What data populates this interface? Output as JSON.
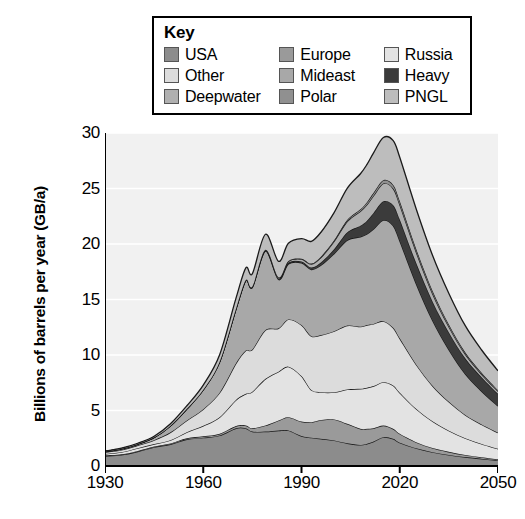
{
  "legend": {
    "title": "Key",
    "entries": [
      {
        "label": "USA",
        "color": "#8c8c8c",
        "column": 0,
        "row": 0
      },
      {
        "label": "Europe",
        "color": "#9a9a9a",
        "column": 1,
        "row": 0
      },
      {
        "label": "Russia",
        "color": "#e3e3e3",
        "column": 2,
        "row": 0
      },
      {
        "label": "Other",
        "color": "#dcdcdc",
        "column": 0,
        "row": 1
      },
      {
        "label": "Mideast",
        "color": "#a8a8a8",
        "column": 1,
        "row": 1
      },
      {
        "label": "Heavy",
        "color": "#3b3b3b",
        "column": 2,
        "row": 1
      },
      {
        "label": "Deepwater",
        "color": "#b0b0b0",
        "column": 0,
        "row": 2
      },
      {
        "label": "Polar",
        "color": "#909090",
        "column": 1,
        "row": 2
      },
      {
        "label": "PNGL",
        "color": "#bdbdbd",
        "column": 2,
        "row": 2
      }
    ]
  },
  "axes": {
    "ylabel": "Billions of barrels per year (GB/a)",
    "xlabel": "",
    "yticks": [
      0,
      5,
      10,
      15,
      20,
      25,
      30
    ],
    "xticks": [
      1930,
      1960,
      1990,
      2020,
      2050
    ],
    "xlim": [
      1930,
      2050
    ],
    "ylim": [
      0,
      30
    ],
    "grid": true
  },
  "chart_data": {
    "type": "area",
    "title": "",
    "xlabel": "",
    "ylabel": "Billions of barrels per year (GB/a)",
    "xlim": [
      1930,
      2050
    ],
    "ylim": [
      0,
      30
    ],
    "grid": true,
    "legend_position": "top",
    "stacked": true,
    "x": [
      1930,
      1935,
      1940,
      1945,
      1950,
      1955,
      1960,
      1965,
      1970,
      1973,
      1975,
      1979,
      1983,
      1986,
      1990,
      1993,
      1996,
      2000,
      2004,
      2008,
      2010,
      2012,
      2015,
      2018,
      2020,
      2025,
      2030,
      2035,
      2040,
      2045,
      2050
    ],
    "series": [
      {
        "name": "USA",
        "color": "#8c8c8c",
        "values": [
          0.9,
          1.0,
          1.3,
          1.7,
          1.95,
          2.4,
          2.55,
          2.75,
          3.4,
          3.4,
          3.1,
          3.1,
          3.2,
          3.2,
          2.7,
          2.55,
          2.45,
          2.3,
          2.05,
          1.9,
          2.0,
          2.2,
          2.6,
          2.45,
          2.1,
          1.6,
          1.25,
          1.0,
          0.8,
          0.65,
          0.5
        ]
      },
      {
        "name": "Europe",
        "color": "#9a9a9a",
        "values": [
          0.05,
          0.05,
          0.06,
          0.06,
          0.08,
          0.1,
          0.12,
          0.15,
          0.2,
          0.25,
          0.3,
          0.55,
          0.9,
          1.2,
          1.3,
          1.4,
          1.7,
          1.9,
          1.75,
          1.45,
          1.35,
          1.2,
          1.05,
          0.9,
          0.8,
          0.55,
          0.38,
          0.28,
          0.2,
          0.14,
          0.1
        ]
      },
      {
        "name": "Russia",
        "color": "#e3e3e3",
        "values": [
          0.15,
          0.2,
          0.25,
          0.22,
          0.3,
          0.55,
          0.95,
          1.5,
          2.35,
          2.85,
          3.3,
          4.2,
          4.4,
          4.55,
          4.1,
          2.9,
          2.5,
          2.45,
          3.1,
          3.6,
          3.7,
          3.8,
          3.9,
          3.9,
          3.7,
          3.0,
          2.4,
          1.9,
          1.5,
          1.2,
          0.95
        ]
      },
      {
        "name": "Other",
        "color": "#dcdcdc",
        "values": [
          0.15,
          0.2,
          0.25,
          0.35,
          0.7,
          1.05,
          1.5,
          2.2,
          3.3,
          3.9,
          3.8,
          4.4,
          3.9,
          4.25,
          4.6,
          4.85,
          5.15,
          5.5,
          5.75,
          5.6,
          5.65,
          5.6,
          5.5,
          5.2,
          4.9,
          4.0,
          3.2,
          2.6,
          2.1,
          1.75,
          1.45
        ]
      },
      {
        "name": "Mideast",
        "color": "#a8a8a8",
        "values": [
          0.05,
          0.1,
          0.12,
          0.25,
          0.6,
          1.05,
          1.75,
          2.8,
          4.9,
          6.3,
          5.6,
          7.1,
          4.4,
          5.0,
          5.6,
          6.0,
          6.3,
          7.0,
          7.7,
          8.1,
          8.2,
          8.55,
          9.1,
          9.2,
          8.8,
          7.3,
          5.9,
          4.7,
          3.7,
          3.0,
          2.4
        ]
      },
      {
        "name": "Heavy",
        "color": "#3b3b3b",
        "values": [
          0.0,
          0.0,
          0.0,
          0.0,
          0.0,
          0.0,
          0.0,
          0.0,
          0.02,
          0.03,
          0.04,
          0.06,
          0.08,
          0.1,
          0.13,
          0.18,
          0.25,
          0.4,
          0.7,
          1.0,
          1.2,
          1.45,
          1.7,
          1.85,
          1.9,
          1.85,
          1.7,
          1.55,
          1.4,
          1.25,
          1.1
        ]
      },
      {
        "name": "Deepwater",
        "color": "#b0b0b0",
        "values": [
          0.0,
          0.0,
          0.0,
          0.0,
          0.0,
          0.0,
          0.0,
          0.0,
          0.0,
          0.02,
          0.03,
          0.05,
          0.08,
          0.12,
          0.2,
          0.3,
          0.45,
          0.7,
          1.0,
          1.3,
          1.45,
          1.55,
          1.6,
          1.5,
          1.35,
          1.0,
          0.72,
          0.52,
          0.38,
          0.28,
          0.22
        ]
      },
      {
        "name": "Polar",
        "color": "#909090",
        "values": [
          0.0,
          0.0,
          0.0,
          0.0,
          0.0,
          0.0,
          0.0,
          0.0,
          0.0,
          0.0,
          0.01,
          0.02,
          0.03,
          0.04,
          0.05,
          0.06,
          0.08,
          0.1,
          0.13,
          0.18,
          0.22,
          0.26,
          0.3,
          0.32,
          0.32,
          0.28,
          0.24,
          0.2,
          0.16,
          0.13,
          0.1
        ]
      },
      {
        "name": "PNGL",
        "color": "#bdbdbd",
        "values": [
          0.03,
          0.05,
          0.07,
          0.1,
          0.18,
          0.28,
          0.42,
          0.62,
          0.95,
          1.1,
          1.15,
          1.4,
          1.45,
          1.6,
          1.8,
          2.0,
          2.2,
          2.5,
          2.85,
          3.2,
          3.4,
          3.6,
          3.85,
          4.0,
          3.95,
          3.6,
          3.2,
          2.8,
          2.4,
          2.05,
          1.75
        ]
      }
    ]
  }
}
